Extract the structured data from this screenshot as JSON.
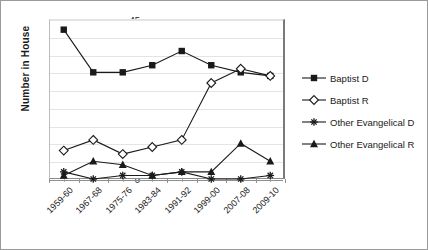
{
  "chart_data": {
    "type": "line",
    "title": "",
    "xlabel": "",
    "ylabel": "Number in House",
    "categories": [
      "1959-60",
      "1967-68",
      "1975-76",
      "1983-84",
      "1991-92",
      "1999-00",
      "2007-08",
      "2009-10"
    ],
    "ylim": [
      0,
      45
    ],
    "ytick_labels": [
      "0",
      "5",
      "10",
      "15",
      "20",
      "25",
      "30",
      "35",
      "40",
      "45"
    ],
    "ytick_values": [
      0,
      5,
      10,
      15,
      20,
      25,
      30,
      35,
      40,
      45
    ],
    "grid": true,
    "legend_position": "right",
    "series": [
      {
        "name": "Baptist D",
        "marker": "filled-square",
        "color": "#1a1a1a",
        "values": [
          42,
          30,
          30,
          32,
          36,
          32,
          30,
          29
        ]
      },
      {
        "name": "Baptist R",
        "marker": "open-diamond",
        "color": "#1a1a1a",
        "values": [
          8,
          11,
          7,
          9,
          11,
          27,
          31,
          29
        ]
      },
      {
        "name": "Other Evangelical D",
        "marker": "asterisk",
        "color": "#1a1a1a",
        "values": [
          2,
          0,
          1,
          1,
          2,
          0,
          0,
          1
        ]
      },
      {
        "name": "Other Evangelical R",
        "marker": "filled-triangle",
        "color": "#1a1a1a",
        "values": [
          1,
          5,
          4,
          1,
          2,
          2,
          10,
          5
        ]
      }
    ]
  },
  "legend": {
    "items": [
      {
        "label": "Baptist D"
      },
      {
        "label": "Baptist R"
      },
      {
        "label": "Other Evangelical D"
      },
      {
        "label": "Other Evangelical R"
      }
    ]
  }
}
